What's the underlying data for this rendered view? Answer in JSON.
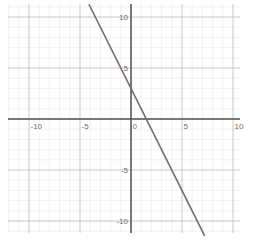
{
  "figure": {
    "width": 254,
    "height": 242,
    "background_color": "#ffffff"
  },
  "chart_data": {
    "type": "line",
    "title": "",
    "subtitle": "",
    "xlabel": "",
    "ylabel": "",
    "xlim": [
      -11.8,
      10.7
    ],
    "ylim": [
      -11.2,
      11.3
    ],
    "grid": true,
    "grid_major_step": 5,
    "grid_minor_step": 1,
    "legend": "none",
    "axes": {
      "x_axis_value": 0,
      "y_axis_value": 0,
      "x_tick_labels": [
        "-10",
        "-5",
        "0",
        "5",
        "10"
      ],
      "x_tick_values": [
        -10,
        -5,
        0,
        5,
        10
      ],
      "y_tick_labels": [
        "10",
        "5",
        "-5",
        "-10"
      ],
      "y_tick_values": [
        10,
        5,
        -5,
        -10
      ]
    },
    "series": [
      {
        "name": "y = -2x + 3",
        "type": "line",
        "equation": "y = -2x + 3",
        "slope": -2,
        "intercept": 3,
        "x_intercept": 1.5,
        "y_intercept": 3,
        "x": [
          -4.1,
          7.2
        ],
        "values": [
          11.2,
          -11.4
        ],
        "points": [
          [
            -4.1,
            11.2
          ],
          [
            0,
            3
          ],
          [
            1.5,
            0
          ],
          [
            7.2,
            -11.4
          ]
        ],
        "color": "#6e6e6e",
        "width": 1.6
      }
    ]
  },
  "colors": {
    "axis": "#555555",
    "grid_major": "#b9b9c4",
    "grid_minor": "#e8e8ee",
    "line": "#6e6e6e",
    "tick_text": "#6b6b6b",
    "background": "#ffffff"
  }
}
